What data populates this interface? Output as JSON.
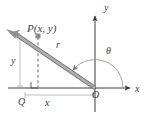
{
  "figure": {
    "colors": {
      "axis": "#3c3c3c",
      "ray": "#8c8c8c",
      "ray_outline": "#6e6e6e",
      "dashed": "#5a5a5a",
      "arc": "#9a9a9a",
      "measure": "#9a9a9a",
      "label": "#3c3c3c",
      "background": "#ffffff"
    },
    "labels": {
      "point": "P(x, y)",
      "radius": "r",
      "angle": "θ",
      "vertical_leg": "y",
      "horizontal_leg": "x",
      "origin": "O",
      "foot": "Q",
      "x_axis": "x",
      "y_axis": "y"
    },
    "elements": {
      "x_axis_name": "x-axis",
      "y_axis_name": "y-axis",
      "ray_name": "terminal-ray-OP",
      "arc_name": "angle-arc-theta",
      "right_angle_name": "right-angle-mark-at-Q",
      "dashed_name": "dashed-segment-PQ",
      "brace_x_name": "measure-bar-x",
      "brace_y_name": "measure-bar-y",
      "point_marker_name": "point-marker-P"
    },
    "geometry": {
      "origin_px": [
        95,
        88
      ],
      "point_px": [
        38,
        35
      ],
      "foot_px": [
        38,
        88
      ],
      "x_axis_end_px": [
        131,
        88
      ],
      "y_axis_top_px": [
        106,
        14
      ],
      "ray_tip_px": [
        11,
        31
      ],
      "angle_degrees": 137
    }
  }
}
